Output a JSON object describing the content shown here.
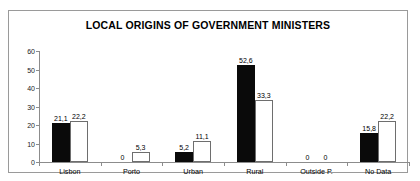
{
  "chart_data": {
    "type": "bar",
    "title": "LOCAL ORIGINS OF GOVERNMENT MINISTERS",
    "xlabel": "",
    "ylabel": "",
    "ylim": [
      0,
      60
    ],
    "yticks": [
      "0",
      "10",
      "20",
      "30",
      "40",
      "50",
      "60"
    ],
    "grid": false,
    "legend": "none",
    "categories": [
      "Lisbon",
      "Porto",
      "Urban",
      "Rural",
      "Outside P.",
      "No Data"
    ],
    "series": [
      {
        "name": "series-1",
        "color": "#0a0a0a",
        "values": [
          21.1,
          0,
          5.2,
          52.6,
          0,
          15.8
        ],
        "labels": [
          "21,1",
          "0",
          "5,2",
          "52,6",
          "0",
          "15,8"
        ]
      },
      {
        "name": "series-2",
        "color": "#ffffff",
        "values": [
          22.2,
          5.3,
          11.1,
          33.3,
          0,
          22.2
        ],
        "labels": [
          "22,2",
          "5,3",
          "11,1",
          "33,3",
          "0",
          "22,2"
        ]
      }
    ]
  }
}
